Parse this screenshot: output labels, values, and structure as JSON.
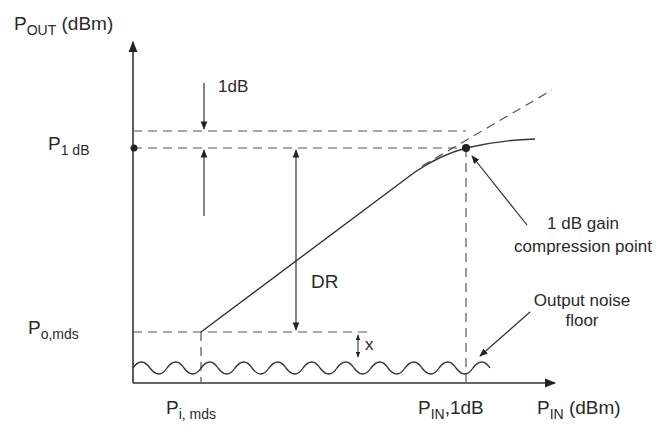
{
  "diagram": {
    "title": "",
    "axes": {
      "y_label_main": "P",
      "y_label_sub": "OUT",
      "y_label_unit": "(dBm)",
      "x_label_main": "P",
      "x_label_sub": "IN",
      "x_label_unit": "(dBm)"
    },
    "y_levels": {
      "p1db_main": "P",
      "p1db_sub": "1 dB",
      "pomds_main": "P",
      "pomds_sub": "o,mds"
    },
    "x_levels": {
      "pimds_main": "P",
      "pimds_sub": "i, mds",
      "pin1db_main": "P",
      "pin1db_sub": "IN",
      "pin1db_suffix": ",1dB"
    },
    "annotations": {
      "one_db": "1dB",
      "dynamic_range": "DR",
      "x_margin": "x",
      "compression_line1": "1 dB gain",
      "compression_line2": "compression point",
      "noise_line1": "Output noise",
      "noise_line2": "floor"
    },
    "colors": {
      "line": "#3a3a3a",
      "dash": "#555555",
      "background": "#ffffff"
    }
  }
}
